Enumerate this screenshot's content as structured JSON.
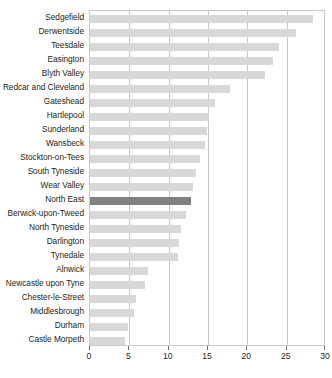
{
  "chart_data": {
    "type": "bar",
    "orientation": "horizontal",
    "title": "",
    "subtitle": "",
    "xlabel": "",
    "ylabel": "",
    "xlim": [
      0,
      30
    ],
    "xticks": [
      0,
      5,
      10,
      15,
      20,
      25,
      30
    ],
    "xtick_labels": [
      "0",
      "5",
      "10",
      "15",
      "20",
      "25",
      "30"
    ],
    "grid": true,
    "grid_axis": "x",
    "legend": false,
    "legend_position": "none",
    "bar_color": "#d8d8d8",
    "highlight_color": "#818181",
    "highlight_category": "North East",
    "categories": [
      "Sedgefield",
      "Derwentside",
      "Teesdale",
      "Easington",
      "Blyth Valley",
      "Redcar and Cleveland",
      "Gateshead",
      "Hartlepool",
      "Sunderland",
      "Wansbeck",
      "Stockton-on-Tees",
      "South Tyneside",
      "Wear Valley",
      "North East",
      "Berwick-upon-Tweed",
      "North Tyneside",
      "Darlington",
      "Tynedale",
      "Alnwick",
      "Newcastle upon Tyne",
      "Chester-le-Street",
      "Middlesbrough",
      "Durham",
      "Castle Morpeth"
    ],
    "values": [
      28.3,
      26.2,
      24.0,
      23.2,
      22.3,
      17.8,
      15.9,
      15.1,
      14.9,
      14.6,
      14.0,
      13.5,
      13.1,
      12.8,
      12.2,
      11.6,
      11.3,
      11.2,
      7.4,
      7.0,
      5.8,
      5.6,
      4.8,
      4.5
    ]
  }
}
